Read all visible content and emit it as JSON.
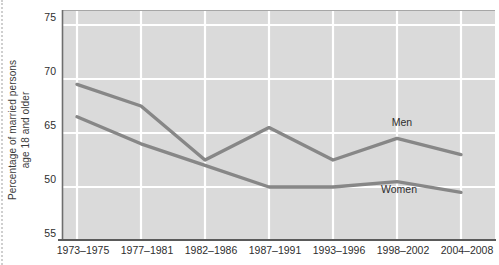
{
  "y_axis_title": {
    "line1": "Percentage of married persons",
    "line2": "age 18 and older"
  },
  "chart_data": {
    "type": "line",
    "title": "",
    "ylabel": "Percentage of married persons age 18 and older",
    "xlabel": "",
    "categories": [
      "1973–1975",
      "1977–1981",
      "1982–1986",
      "1987–1991",
      "1993–1996",
      "1998–2002",
      "2004–2008"
    ],
    "y_ticks": [
      {
        "label": "75",
        "value": 75
      },
      {
        "label": "70",
        "value": 70
      },
      {
        "label": "65",
        "value": 65
      },
      {
        "label": "50",
        "value": 60
      },
      {
        "label": "55",
        "value": 55
      }
    ],
    "ylim": [
      55,
      76.4
    ],
    "grid": true,
    "legend_position": "inline-labels",
    "series": [
      {
        "name": "Men",
        "values": [
          69.5,
          67.5,
          62.5,
          65.5,
          62.5,
          64.5,
          63.0
        ]
      },
      {
        "name": "Women",
        "values": [
          66.5,
          64.0,
          62.0,
          60.0,
          60.0,
          60.5,
          59.5
        ]
      }
    ],
    "colors": {
      "line": "#878787",
      "plot_bg": "#dadada",
      "gridline": "#ffffff",
      "axis": "#666666",
      "text": "#2e2e2e"
    }
  }
}
